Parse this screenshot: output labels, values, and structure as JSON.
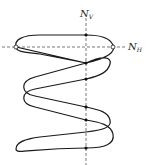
{
  "diagram": {
    "type": "curve-with-axes",
    "labels": {
      "vertical_axis": "N",
      "vertical_axis_sub": "V",
      "horizontal_axis": "N",
      "horizontal_axis_sub": "H"
    },
    "colors": {
      "curve": "#1a1a1a",
      "axis": "#555555",
      "background": "#ffffff"
    },
    "vertical_axis_x": 86,
    "horizontal_axis_y": 47,
    "open_points": [
      [
        16,
        47
      ],
      [
        113,
        47
      ]
    ],
    "filled_points_on_vertical": [
      35,
      63,
      79,
      107,
      120,
      148
    ]
  }
}
